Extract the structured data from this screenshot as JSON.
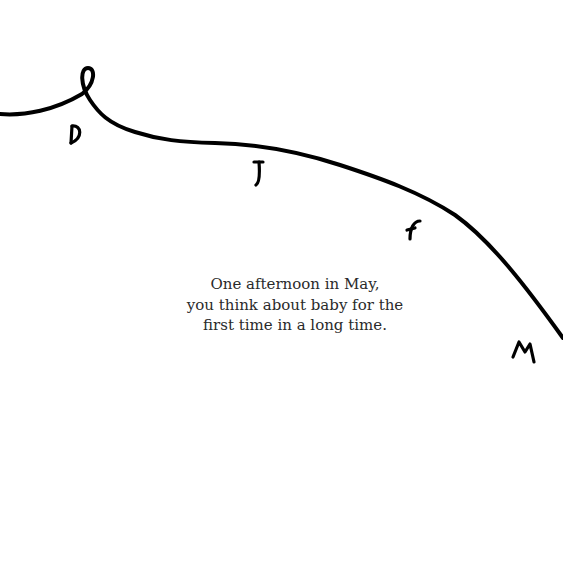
{
  "timeline": {
    "stroke_color": "#000000",
    "labels": [
      {
        "id": "d",
        "text": "D"
      },
      {
        "id": "j",
        "text": "J"
      },
      {
        "id": "f",
        "text": "f"
      },
      {
        "id": "m",
        "text": "M"
      }
    ]
  },
  "caption": {
    "lines": [
      "One afternoon in May,",
      "you think about baby for the",
      "first time in a long time."
    ]
  }
}
